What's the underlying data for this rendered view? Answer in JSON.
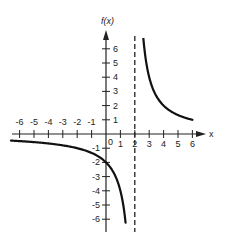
{
  "chart_data": {
    "type": "line",
    "title": "",
    "xlabel": "x",
    "ylabel": "f(x)",
    "xlim": [
      -6.5,
      6.5
    ],
    "ylim": [
      -6.5,
      6.5
    ],
    "grid": false,
    "legend": null,
    "x_ticks": [
      -6,
      -5,
      -4,
      -3,
      -2,
      -1,
      0,
      1,
      2,
      3,
      4,
      5,
      6
    ],
    "x_tick_labels": [
      "-6",
      "-5",
      "-4",
      "-3",
      "-2",
      "-1",
      "0",
      "1",
      "2",
      "3",
      "4",
      "5",
      "6"
    ],
    "y_ticks": [
      -6,
      -5,
      -4,
      -3,
      -2,
      -1,
      1,
      2,
      3,
      4,
      5,
      6
    ],
    "y_tick_labels": [
      "-6",
      "-5",
      "-4",
      "-3",
      "-2",
      "-1",
      "1",
      "2",
      "3",
      "4",
      "5",
      "6"
    ],
    "function": "f(x) = 4 / (x - 2) approx (rational function with vertical asymptote)",
    "vertical_asymptote": {
      "x": 2,
      "style": "dashed"
    },
    "horizontal_asymptote": {
      "y": 0
    },
    "series": [
      {
        "name": "left branch",
        "x": [
          -6.5,
          -6,
          -5,
          -4,
          -3,
          -2,
          -1,
          0,
          0.5,
          1,
          1.3,
          1.5,
          1.7
        ],
        "y": [
          -0.47,
          -0.5,
          -0.57,
          -0.67,
          -0.8,
          -1.0,
          -1.33,
          -2.0,
          -2.67,
          -4.0,
          -5.7,
          -8.0,
          -13.3
        ]
      },
      {
        "name": "right branch",
        "x": [
          2.6,
          2.8,
          3,
          3.5,
          4,
          4.5,
          5,
          5.5,
          6
        ],
        "y": [
          6.67,
          5.0,
          4.0,
          2.67,
          2.0,
          1.6,
          1.33,
          1.14,
          1.0
        ]
      }
    ]
  },
  "labels": {
    "y_axis": "f(x)",
    "x_axis": "x",
    "origin": "0"
  }
}
